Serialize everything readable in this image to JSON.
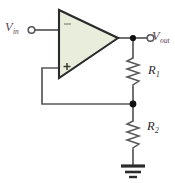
{
  "figure": {
    "name": "non-inverting-op-amp-amplifier",
    "background_color": "#ffffff"
  },
  "colors": {
    "wire": "#58585a",
    "opamp_fill": "#e9eedc",
    "opamp_stroke": "#2b2b2b",
    "node_dot": "#101010",
    "voltage_label": "#5d4550",
    "resistor_label": "#2a2a2a",
    "ground": "#2b2b2b"
  },
  "labels": {
    "vin": {
      "symbol": "V",
      "subscript": "in",
      "full": "Vin"
    },
    "vout": {
      "symbol": "V",
      "subscript": "out",
      "full": "Vout"
    },
    "r1": {
      "symbol": "R",
      "subscript": "1",
      "full": "R1"
    },
    "r2": {
      "symbol": "R",
      "subscript": "2",
      "full": "R2"
    }
  },
  "opamp": {
    "name": "operational-amplifier",
    "inverting_input_sign": "−",
    "non_inverting_input_sign": "+",
    "shape": "triangle"
  },
  "components": [
    {
      "name": "resistor-r1",
      "type": "resistor",
      "label": "R1",
      "orientation": "vertical"
    },
    {
      "name": "resistor-r2",
      "type": "resistor",
      "label": "R2",
      "orientation": "vertical"
    },
    {
      "name": "ground-symbol",
      "type": "ground",
      "label": ""
    }
  ],
  "terminals": [
    {
      "name": "input-terminal",
      "label": "Vin",
      "style": "open-circle"
    },
    {
      "name": "output-terminal",
      "label": "Vout",
      "style": "open-circle"
    }
  ],
  "nodes": [
    {
      "name": "output-node",
      "style": "filled-dot"
    },
    {
      "name": "feedback-divider-node",
      "style": "filled-dot"
    }
  ]
}
